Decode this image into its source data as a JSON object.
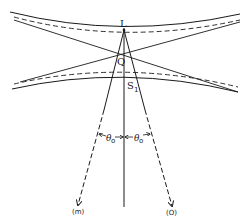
{
  "diagram": {
    "type": "ray-optics / beam caustic diagram",
    "colors": {
      "ink": "#1a1a1a",
      "background": "#ffffff"
    },
    "labels": {
      "L": "L",
      "Q": "Q",
      "S": "S",
      "S_sub": "1",
      "theta_left": "θ",
      "theta_left_sub": "o",
      "theta_right": "θ",
      "theta_right_sub": "o",
      "ray_m": "(m)",
      "ray_o": "(O)"
    },
    "elements": [
      "upper-hyperbola-solid",
      "upper-hyperbola-dashed",
      "lower-hyperbola-solid",
      "lower-hyperbola-dashed",
      "crossing-line-descending",
      "crossing-line-ascending",
      "optical-axis",
      "ray-m",
      "ray-o",
      "angle-marker-left",
      "angle-marker-right"
    ]
  }
}
